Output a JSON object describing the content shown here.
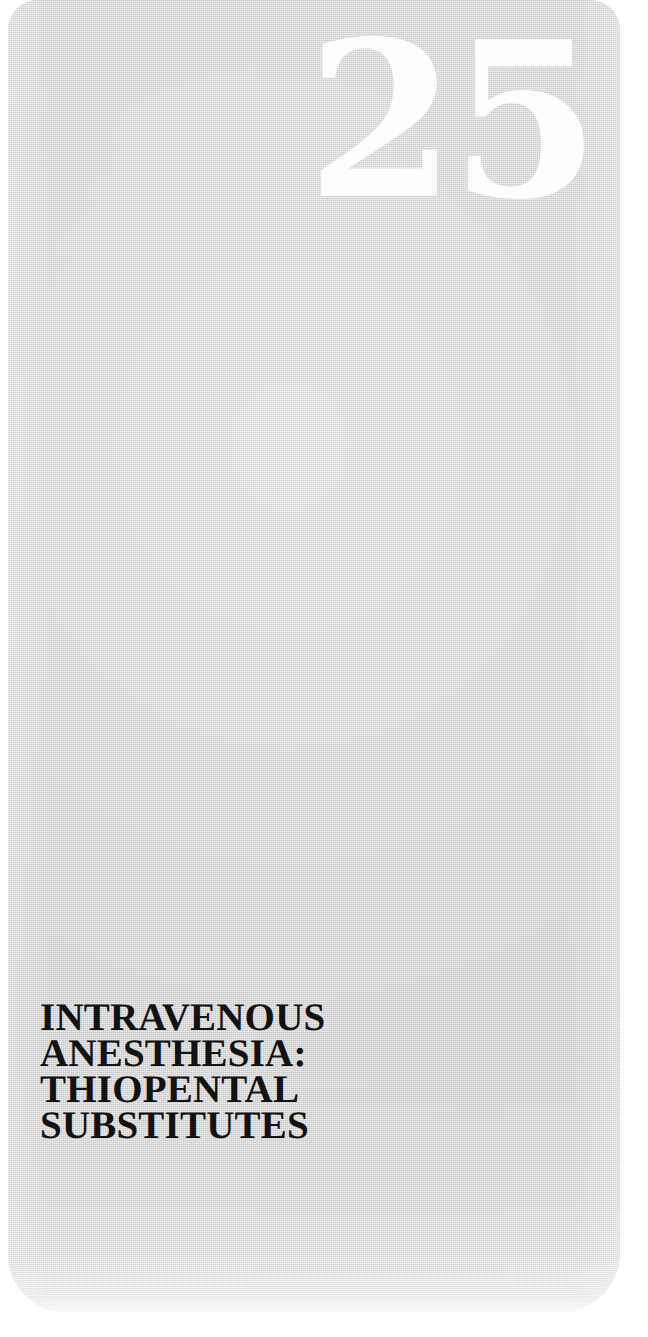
{
  "page": {
    "kind": "book-chapter-opening-page",
    "background_color": "#ffffff",
    "panel_color": "#d5d5d5"
  },
  "chapter": {
    "number": "25",
    "number_color": "#fdfdfd",
    "title_color": "#121212",
    "title_lines": [
      "INTRAVENOUS",
      "ANESTHESIA:",
      "THIOPENTAL",
      "SUBSTITUTES"
    ],
    "title_full": "INTRAVENOUS ANESTHESIA: THIOPENTAL SUBSTITUTES"
  }
}
